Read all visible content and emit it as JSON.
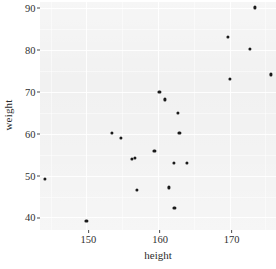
{
  "chart_data": {
    "type": "scatter",
    "title": "",
    "xlabel": "height",
    "ylabel": "weight",
    "xlim": [
      143.5,
      176.5
    ],
    "ylim": [
      37.0,
      91.5
    ],
    "xticks": [
      150,
      160,
      170
    ],
    "xtick_labels": [
      "150",
      "160",
      "170"
    ],
    "yticks": [
      40,
      50,
      60,
      70,
      80,
      90
    ],
    "ytick_labels": [
      "40",
      "50",
      "60",
      "70",
      "80",
      "90"
    ],
    "grid": true,
    "grid_color": "#ffffff",
    "panel_background": "#ebebeb",
    "point_color": "#1a1a1a",
    "legend": "none",
    "n_points": 21,
    "points": [
      {
        "height": 144.2,
        "weight": 49.2
      },
      {
        "height": 150.0,
        "weight": 39.2
      },
      {
        "height": 153.6,
        "weight": 60.2
      },
      {
        "height": 154.8,
        "weight": 59.0
      },
      {
        "height": 156.8,
        "weight": 54.2
      },
      {
        "height": 157.0,
        "weight": 46.5
      },
      {
        "height": 159.5,
        "weight": 56.0
      },
      {
        "height": 160.2,
        "weight": 70.0
      },
      {
        "height": 161.0,
        "weight": 68.2
      },
      {
        "height": 161.5,
        "weight": 47.2
      },
      {
        "height": 162.2,
        "weight": 53.0
      },
      {
        "height": 162.3,
        "weight": 42.2
      },
      {
        "height": 162.8,
        "weight": 65.0
      },
      {
        "height": 163.0,
        "weight": 60.2
      },
      {
        "height": 164.0,
        "weight": 53.0
      },
      {
        "height": 169.8,
        "weight": 83.2
      },
      {
        "height": 170.0,
        "weight": 73.2
      },
      {
        "height": 172.8,
        "weight": 80.2
      },
      {
        "height": 173.5,
        "weight": 90.2
      },
      {
        "height": 175.8,
        "weight": 74.2
      },
      {
        "height": 156.3,
        "weight": 54.0
      }
    ]
  },
  "axes": {
    "x_title": "height",
    "y_title": "weight"
  },
  "artifacts": {
    "watermark_text": "",
    "caption_fragment": ""
  }
}
